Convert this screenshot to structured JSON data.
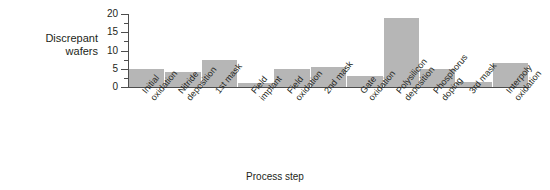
{
  "chart_data": {
    "type": "bar",
    "title": "",
    "xlabel": "Process step",
    "ylabel": "Discrepant wafers",
    "ylabel_line1": "Discrepant",
    "ylabel_line2": "wafers",
    "ylim": [
      0,
      20
    ],
    "yticks": [
      0,
      5,
      10,
      15,
      20
    ],
    "ytick_labels": [
      "0",
      "5",
      "10",
      "15",
      "20"
    ],
    "minor_ticks": true,
    "grid": false,
    "legend": null,
    "bar_color": "#b6b6b6",
    "axis_color": "#4d4d4d",
    "categories": [
      "Initial oxidation",
      "Nitride deposition",
      "1st mask",
      "Field implant",
      "Field oxidation",
      "2nd mask",
      "Gate oxidation",
      "Polysilicon deposition",
      "Phosphorus doping",
      "3rd mask",
      "Interpoly oxidation"
    ],
    "category_lines": [
      [
        "Initial",
        "oxidation"
      ],
      [
        "Nitride",
        "deposition"
      ],
      [
        "1st mask"
      ],
      [
        "Field",
        "implant"
      ],
      [
        "Field",
        "oxidation"
      ],
      [
        "2nd mask"
      ],
      [
        "Gate",
        "oxidation"
      ],
      [
        "Polysilicon",
        "deposition"
      ],
      [
        "Phosphorus",
        "doping"
      ],
      [
        "3rd mask"
      ],
      [
        "Interpoly",
        "oxidation"
      ]
    ],
    "values": [
      5,
      4,
      7.5,
      1,
      5,
      5.5,
      3,
      19,
      5,
      1.5,
      6.5
    ]
  }
}
